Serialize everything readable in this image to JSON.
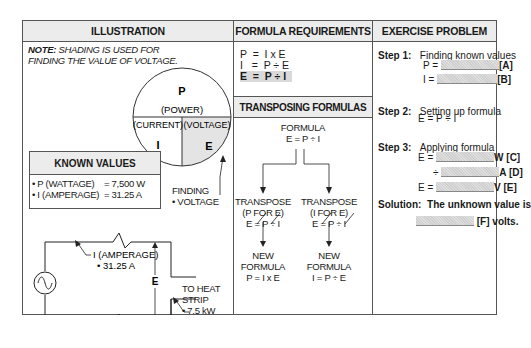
{
  "columns": {
    "illustration": "ILLUSTRATION",
    "formula_requirements": "FORMULA REQUIREMENTS",
    "exercise_problem": "EXERCISE PROBLEM"
  },
  "illustration": {
    "note_label": "NOTE:",
    "note_line1": " SHADING IS USED FOR",
    "note_line2": "FINDING THE VALUE OF VOLTAGE.",
    "circle": {
      "top_letter": "P",
      "top_word": "(POWER)",
      "left_word": "(CURRENT)",
      "left_letter": "I",
      "right_word": "(VOLTAGE)",
      "right_letter": "E",
      "shaded": "E"
    },
    "finding_line1": "FINDING",
    "finding_line2": "• VOLTAGE",
    "known_values": {
      "title": "KNOWN VALUES",
      "rows": [
        {
          "label": "• P (WATTAGE)",
          "value": "= 7,500 W"
        },
        {
          "label": "• I (AMPERAGE)",
          "value": "= 31.25 A"
        }
      ]
    },
    "circuit": {
      "amperage_line1": "I (AMPERAGE)",
      "amperage_line2": "• 31.25 A",
      "voltage_label": "E",
      "heat_line1": "TO HEAT",
      "heat_line2": "STRIP",
      "heat_line3": "• 7.5 kW"
    }
  },
  "formula_requirements": {
    "lines": [
      {
        "text": "P  =  I x E",
        "highlighted": false
      },
      {
        "text": "I   =  P ÷ E",
        "highlighted": false
      },
      {
        "text": "E  =  P ÷ I",
        "highlighted": true
      }
    ]
  },
  "transposing": {
    "title": "TRANSPOSING FORMULAS",
    "formula_label": "FORMULA",
    "formula": "E = P ÷ I",
    "left": {
      "line1": "TRANSPOSE",
      "line2": "(P FOR E)",
      "line3": "E = P ÷ I",
      "new1": "NEW",
      "new2": "FORMULA",
      "new3": "P = I x E"
    },
    "right": {
      "line1": "TRANSPOSE",
      "line2": "(I FOR E)",
      "line3": "E = P ÷ I",
      "new1": "NEW",
      "new2": "FORMULA",
      "new3": "I = P ÷ E"
    }
  },
  "exercise": {
    "step1_label": "Step 1:",
    "step1_text": "Finding known values",
    "p_eq": "P =",
    "p_tag": "[A]",
    "i_eq": "I =",
    "i_tag": "[B]",
    "step2_label": "Step 2:",
    "step2_text": "Setting up formula",
    "step2_formula": "E = P ÷ I",
    "step3_label": "Step 3:",
    "step3_text": "Applying formula",
    "c_eq": "E =",
    "c_tag": "W [C]",
    "d_eq": "÷",
    "d_tag": "A [D]",
    "e_eq": "E =",
    "e_tag": "V [E]",
    "solution_label": "Solution:",
    "solution_text": "The unknown value is",
    "f_tag": "[F] volts."
  }
}
